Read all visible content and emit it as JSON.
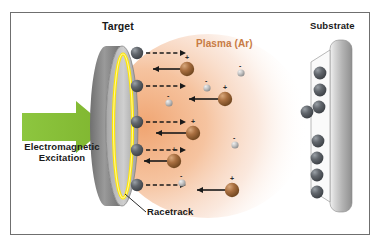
{
  "figure": {
    "type": "magnetron-sputtering-schematic",
    "border_color": "#6f6f6f",
    "background": "#ffffff"
  },
  "labels": {
    "target": "Target",
    "substrate": "Substrate",
    "plasma": "Plasma (Ar)",
    "excitation_line1": "Electromagnetic",
    "excitation_line2": "Excitation",
    "racetrack": "Racetrack"
  },
  "colors": {
    "plasma_text": "#c87b44",
    "plasma_cloud": "#f2b183",
    "green_arrow": "#8cc63e",
    "target_body": "#8e8e8e",
    "target_face": "#b5b5b5",
    "racetrack_glow": "#ffe800",
    "substrate_body": "#c9c9c9",
    "sputtered_atom": "#5a5f66",
    "ion": "#a4693c",
    "electron": "#bdbdbd",
    "arrow_solid": "#1a1a1a",
    "arrow_dashed": "#1a1a1a"
  },
  "elements": {
    "green_arrow": {
      "name": "electromagnetic-excitation-arrow",
      "direction": "right"
    },
    "target": {
      "shape": "ellipse-disk",
      "cx": 122,
      "cy": 125,
      "rx": 16,
      "ry": 84
    },
    "substrate": {
      "shape": "rounded-plate",
      "x": 330,
      "y": 40,
      "w": 22,
      "h": 172
    },
    "racetrack": {
      "shape": "ellipse-outline",
      "color": "#ffe800"
    }
  },
  "sputtered_atoms": {
    "label": "sputtered target atoms leaving racetrack",
    "count": 5,
    "positions": [
      {
        "x": 137,
        "y": 53
      },
      {
        "x": 137,
        "y": 86
      },
      {
        "x": 137,
        "y": 122
      },
      {
        "x": 137,
        "y": 150
      },
      {
        "x": 137,
        "y": 185
      }
    ]
  },
  "dashed_arrows": {
    "label": "sputtered-atom trajectories toward substrate",
    "direction": "right",
    "count": 5,
    "items": [
      {
        "x1": 146,
        "y": 53,
        "x2": 188
      },
      {
        "x1": 146,
        "y": 86,
        "x2": 188
      },
      {
        "x1": 146,
        "y": 122,
        "x2": 188
      },
      {
        "x1": 146,
        "y": 150,
        "x2": 188
      },
      {
        "x1": 146,
        "y": 185,
        "x2": 188
      }
    ]
  },
  "ions": {
    "label": "argon ions accelerated toward target",
    "charge": "+",
    "count": 5,
    "positions": [
      {
        "x": 187,
        "y": 69
      },
      {
        "x": 225,
        "y": 99
      },
      {
        "x": 193,
        "y": 133
      },
      {
        "x": 174,
        "y": 161
      },
      {
        "x": 232,
        "y": 190
      }
    ]
  },
  "solid_arrows": {
    "label": "ion trajectories toward target",
    "direction": "left",
    "count": 5,
    "items": [
      {
        "x1": 179,
        "y": 69,
        "x2": 152
      },
      {
        "x1": 217,
        "y": 99,
        "x2": 188
      },
      {
        "x1": 185,
        "y": 133,
        "x2": 155
      },
      {
        "x1": 166,
        "y": 161,
        "x2": 143
      },
      {
        "x1": 224,
        "y": 190,
        "x2": 196
      }
    ]
  },
  "electrons": {
    "label": "free electrons in plasma",
    "charge": "-",
    "count": 5,
    "positions": [
      {
        "x": 241,
        "y": 73
      },
      {
        "x": 207,
        "y": 88
      },
      {
        "x": 169,
        "y": 103
      },
      {
        "x": 235,
        "y": 145
      },
      {
        "x": 182,
        "y": 183
      }
    ]
  },
  "deposited_atoms": {
    "label": "atoms deposited on substrate",
    "count": 8,
    "positions": [
      {
        "x": 320,
        "y": 73
      },
      {
        "x": 320,
        "y": 90
      },
      {
        "x": 318,
        "y": 107
      },
      {
        "x": 307,
        "y": 112
      },
      {
        "x": 318,
        "y": 141
      },
      {
        "x": 316,
        "y": 158
      },
      {
        "x": 316,
        "y": 175
      },
      {
        "x": 316,
        "y": 192
      }
    ]
  }
}
